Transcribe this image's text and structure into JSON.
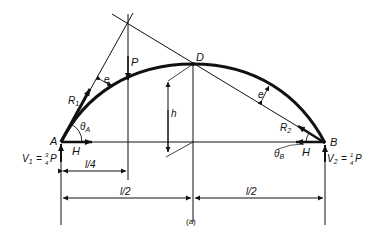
{
  "figure": {
    "caption": "(a)",
    "points": {
      "A": "A",
      "B": "B",
      "D": "D"
    },
    "forces": {
      "P": "P",
      "R1": "R",
      "R1_sub": "1",
      "R2": "R",
      "R2_sub": "2",
      "H_left": "H",
      "H_right": "H",
      "V1_label": "V",
      "V1_sub": "1",
      "V1_eq": "= ",
      "V1_num": "3",
      "V1_den": "4",
      "V1_P": "P",
      "V2_label": "V",
      "V2_sub": "2",
      "V2_eq": "= ",
      "V2_num": "1",
      "V2_den": "4",
      "V2_P": "P"
    },
    "angles": {
      "thetaA": "θ",
      "thetaA_sub": "A",
      "thetaB": "θ",
      "thetaB_sub": "B"
    },
    "eccentricity": {
      "e_left": "e",
      "e_right": "e"
    },
    "rise": "h",
    "dimensions": {
      "quarter_span": "l/4",
      "half_span_left": "l/2",
      "half_span_right": "l/2"
    },
    "colors": {
      "ink": "#111111",
      "background": "#ffffff"
    }
  }
}
